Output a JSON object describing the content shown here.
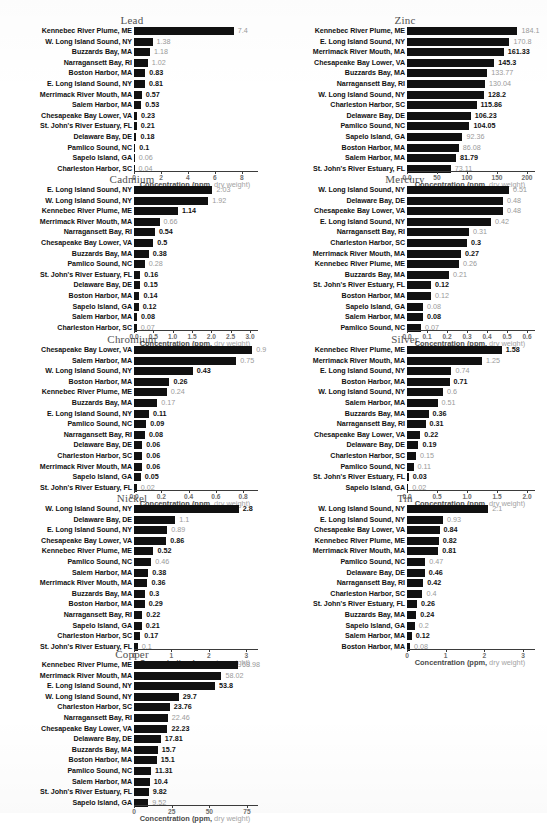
{
  "figure": {
    "axis_title_main": "Concentration (ppm,",
    "axis_title_dim": " dry weight)",
    "axis_title_full": "Concentration (ppm, dry weight)"
  },
  "chart_data": [
    {
      "type": "bar",
      "orientation": "horizontal",
      "title": "Lead",
      "xlabel": "Concentration (ppm, dry weight)",
      "ylabel": "",
      "xlim": [
        0,
        8.6
      ],
      "ticks": [
        "0",
        "2",
        "4",
        "6",
        "8"
      ],
      "tickvals": [
        0,
        2,
        4,
        6,
        8
      ],
      "grid": false,
      "categories": [
        "Kennebec River Plume, ME",
        "W. Long Island Sound, NY",
        "Buzzards Bay, MA",
        "Narragansett Bay, RI",
        "Boston Harbor, MA",
        "E. Long Island Sound, NY",
        "Merrimack River Mouth, MA",
        "Salem Harbor, MA",
        "Chesapeake Bay Lower, VA",
        "St. John's River Estuary, FL",
        "Delaware Bay, DE",
        "Pamlico Sound, NC",
        "Sapelo Island, GA",
        "Charleston Harbor, SC"
      ],
      "values": [
        7.4,
        1.38,
        1.18,
        1.02,
        0.83,
        0.81,
        0.57,
        0.53,
        0.23,
        0.21,
        0.18,
        0.1,
        0.06,
        0.04
      ],
      "labels": [
        "7.4",
        "1.38",
        "1.18",
        "1.02",
        "0.83",
        "0.81",
        "0.57",
        "0.53",
        "0.23",
        "0.21",
        "0.18",
        "0.1",
        "0.06",
        "0.04"
      ],
      "faint": [
        true,
        true,
        true,
        true,
        false,
        false,
        false,
        false,
        false,
        false,
        false,
        false,
        true,
        true
      ]
    },
    {
      "type": "bar",
      "orientation": "horizontal",
      "title": "Zinc",
      "xlabel": "Concentration (ppm, dry weight)",
      "ylabel": "",
      "xlim": [
        0,
        200
      ],
      "ticks": [
        "0.0",
        "50",
        "100",
        "150",
        "200"
      ],
      "tickvals": [
        0,
        50,
        100,
        150,
        200
      ],
      "grid": false,
      "categories": [
        "Kennebec River Plume, ME",
        "E. Long Island Sound, NY",
        "Merrimack River Mouth, MA",
        "Chesapeake Bay Lower, VA",
        "Buzzards Bay, MA",
        "Narragansett Bay, RI",
        "W. Long Island Sound, NY",
        "Charleston Harbor, SC",
        "Delaware Bay, DE",
        "Pamlico Sound, NC",
        "Sapelo Island, GA",
        "Boston Harbor, MA",
        "Salem Harbor, MA",
        "St. John's River Estuary, FL"
      ],
      "values": [
        184.1,
        170.8,
        161.33,
        145.3,
        133.77,
        130.04,
        128.2,
        115.86,
        106.23,
        104.05,
        92.36,
        86.08,
        81.79,
        73.11
      ],
      "labels": [
        "184.1",
        "170.8",
        "161.33",
        "145.3",
        "133.77",
        "130.04",
        "128.2",
        "115.86",
        "106.23",
        "104.05",
        "92.36",
        "86.08",
        "81.79",
        "73.11"
      ],
      "faint": [
        true,
        true,
        false,
        false,
        true,
        true,
        false,
        false,
        false,
        false,
        true,
        true,
        false,
        true
      ]
    },
    {
      "type": "bar",
      "orientation": "horizontal",
      "title": "Cadmium",
      "xlabel": "Concentration (ppm, dry weight)",
      "ylabel": "",
      "xlim": [
        0,
        3.0
      ],
      "ticks": [
        "0.0",
        "0.5",
        "1.0",
        "1.5",
        "2.0",
        "2.5",
        "3.0"
      ],
      "tickvals": [
        0,
        0.5,
        1.0,
        1.5,
        2.0,
        2.5,
        3.0
      ],
      "grid": false,
      "categories": [
        "E. Long Island Sound, NY",
        "W. Long Island Sound, NY",
        "Kennebec River Plume, ME",
        "Merrimack River Mouth, MA",
        "Narragansett Bay, RI",
        "Chesapeake Bay Lower, VA",
        "Buzzards Bay, MA",
        "Pamlico Sound, NC",
        "St. John's River Estuary, FL",
        "Delaware Bay, DE",
        "Boston Harbor, MA",
        "Sapelo Island, GA",
        "Salem Harbor, MA",
        "Charleston Harbor, SC"
      ],
      "values": [
        2.03,
        1.92,
        1.14,
        0.66,
        0.54,
        0.5,
        0.38,
        0.28,
        0.16,
        0.15,
        0.14,
        0.12,
        0.08,
        0.07
      ],
      "labels": [
        "2.03",
        "1.92",
        "1.14",
        "0.66",
        "0.54",
        "0.5",
        "0.38",
        "0.28",
        "0.16",
        "0.15",
        "0.14",
        "0.12",
        "0.08",
        "0.07"
      ],
      "faint": [
        true,
        true,
        false,
        true,
        false,
        false,
        false,
        true,
        false,
        false,
        false,
        false,
        false,
        true
      ]
    },
    {
      "type": "bar",
      "orientation": "horizontal",
      "title": "Mercury",
      "xlabel": "Concentration (ppm, dry weight)",
      "ylabel": "",
      "xlim": [
        0,
        0.6
      ],
      "ticks": [
        "0.0",
        "0.1",
        "0.2",
        "0.3",
        "0.4",
        "0.5",
        "0.6"
      ],
      "tickvals": [
        0,
        0.1,
        0.2,
        0.3,
        0.4,
        0.5,
        0.6
      ],
      "grid": false,
      "categories": [
        "W. Long Island Sound, NY",
        "Delaware Bay, DE",
        "Chesapeake Bay Lower, VA",
        "E. Long Island Sound, NY",
        "Narragansett Bay, RI",
        "Charleston Harbor, SC",
        "Merrimack River Mouth, MA",
        "Kennebec River Plume, ME",
        "Buzzards Bay, MA",
        "St. John's River Estuary, FL",
        "Boston Harbor, MA",
        "Sapelo Island, GA",
        "Salem Harbor, MA",
        "Pamlico Sound, NC"
      ],
      "values": [
        0.51,
        0.48,
        0.48,
        0.42,
        0.31,
        0.3,
        0.27,
        0.26,
        0.21,
        0.12,
        0.12,
        0.08,
        0.08,
        0.07
      ],
      "labels": [
        "0.51",
        "0.48",
        "0.48",
        "0.42",
        "0.31",
        "0.3",
        "0.27",
        "0.26",
        "0.21",
        "0.12",
        "0.12",
        "0.08",
        "0.08",
        "0.07"
      ],
      "faint": [
        true,
        true,
        true,
        true,
        true,
        false,
        false,
        true,
        true,
        false,
        true,
        true,
        false,
        true
      ]
    },
    {
      "type": "bar",
      "orientation": "horizontal",
      "title": "Chromium",
      "xlabel": "Concentration (ppm, dry weight)",
      "ylabel": "",
      "xlim": [
        0,
        0.85
      ],
      "ticks": [
        "0.0",
        "0.2",
        "0.4",
        "0.6",
        "0.8",
        "1.0"
      ],
      "tickvals": [
        0,
        0.2,
        0.4,
        0.6,
        0.8,
        1.0
      ],
      "grid": false,
      "categories": [
        "Chesapeake Bay Lower, VA",
        "Salem Harbor, MA",
        "W. Long Island Sound, NY",
        "Boston Harbor, MA",
        "Kennebec River Plume, ME",
        "Buzzards Bay, MA",
        "E. Long Island Sound, NY",
        "Pamlico Sound, NC",
        "Narragansett Bay, RI",
        "Delaware Bay, DE",
        "Charleston Harbor, SC",
        "Merrimack River Mouth, MA",
        "Sapelo Island, GA",
        "St. John's River Estuary, FL"
      ],
      "values": [
        0.9,
        0.75,
        0.43,
        0.26,
        0.24,
        0.17,
        0.11,
        0.09,
        0.08,
        0.06,
        0.06,
        0.06,
        0.05,
        0.02
      ],
      "labels": [
        "0.9",
        "0.75",
        "0.43",
        "0.26",
        "0.24",
        "0.17",
        "0.11",
        "0.09",
        "0.08",
        "0.06",
        "0.06",
        "0.06",
        "0.05",
        "0.02"
      ],
      "faint": [
        true,
        true,
        false,
        false,
        true,
        true,
        false,
        false,
        false,
        false,
        false,
        false,
        false,
        true
      ]
    },
    {
      "type": "bar",
      "orientation": "horizontal",
      "title": "Silver",
      "xlabel": "Concentration (ppm, dry weight)",
      "ylabel": "",
      "xlim": [
        0,
        2.0
      ],
      "ticks": [
        "0.0",
        "0.5",
        "1.0",
        "1.5",
        "2.0"
      ],
      "tickvals": [
        0,
        0.5,
        1.0,
        1.5,
        2.0
      ],
      "grid": false,
      "categories": [
        "Kennebec River Plume, ME",
        "Merrimack River Mouth, MA",
        "E. Long Island Sound, NY",
        "Boston Harbor, MA",
        "W. Long Island Sound, NY",
        "Salem Harbor, MA",
        "Buzzards Bay, MA",
        "Narragansett Bay, RI",
        "Chesapeake Bay Lower, VA",
        "Delaware Bay, DE",
        "Charleston Harbor, SC",
        "Pamlico Sound, NC",
        "St. John's River Estuary, FL",
        "Sapelo Island, GA"
      ],
      "values": [
        1.58,
        1.25,
        0.74,
        0.71,
        0.6,
        0.51,
        0.36,
        0.31,
        0.22,
        0.19,
        0.15,
        0.11,
        0.03,
        0.02
      ],
      "labels": [
        "1.58",
        "1.25",
        "0.74",
        "0.71",
        "0.6",
        "0.51",
        "0.36",
        "0.31",
        "0.22",
        "0.19",
        "0.15",
        "0.11",
        "0.03",
        "0.02"
      ],
      "faint": [
        false,
        true,
        true,
        false,
        true,
        true,
        false,
        false,
        false,
        false,
        true,
        true,
        false,
        true
      ]
    },
    {
      "type": "bar",
      "orientation": "horizontal",
      "title": "Nickel",
      "xlabel": "Concentration (ppm, dry weight)",
      "ylabel": "",
      "xlim": [
        0,
        3.1
      ],
      "ticks": [
        "0",
        "1",
        "2",
        "3"
      ],
      "tickvals": [
        0,
        1,
        2,
        3
      ],
      "grid": false,
      "categories": [
        "W. Long Island Sound, NY",
        "Delaware Bay, DE",
        "E. Long Island Sound, NY",
        "Chesapeake Bay Lower, VA",
        "Kennebec River Plume, ME",
        "Pamlico Sound, NC",
        "Salem Harbor, MA",
        "Merrimack River Mouth, MA",
        "Buzzards Bay, MA",
        "Boston Harbor, MA",
        "Narragansett Bay, RI",
        "Sapelo Island, GA",
        "Charleston Harbor, SC",
        "St. John's River Estuary, FL"
      ],
      "values": [
        2.8,
        1.1,
        0.89,
        0.86,
        0.52,
        0.46,
        0.38,
        0.36,
        0.3,
        0.29,
        0.22,
        0.21,
        0.17,
        0.1
      ],
      "labels": [
        "2.8",
        "1.1",
        "0.89",
        "0.86",
        "0.52",
        "0.46",
        "0.38",
        "0.36",
        "0.3",
        "0.29",
        "0.22",
        "0.21",
        "0.17",
        "0.1"
      ],
      "faint": [
        false,
        true,
        true,
        false,
        false,
        true,
        false,
        false,
        false,
        false,
        false,
        false,
        false,
        true
      ]
    },
    {
      "type": "bar",
      "orientation": "horizontal",
      "title": "Tin",
      "xlabel": "Concentration (ppm, dry weight)",
      "ylabel": "",
      "xlim": [
        0,
        3.1
      ],
      "ticks": [
        "0",
        "1",
        "2",
        "3"
      ],
      "tickvals": [
        0,
        1,
        2,
        3
      ],
      "grid": false,
      "categories": [
        "W. Long Island Sound, NY",
        "E. Long Island Sound, NY",
        "Chesapeake Bay Lower, VA",
        "Kennebec River Plume, ME",
        "Merrimack River Mouth, MA",
        "Pamlico Sound, NC",
        "Delaware Bay, DE",
        "Narragansett Bay, RI",
        "Charleston Harbor, SC",
        "St. John's River Estuary, FL",
        "Buzzards Bay, MA",
        "Sapelo Island, GA",
        "Salem Harbor, MA",
        "Boston Harbor, MA"
      ],
      "values": [
        2.1,
        0.93,
        0.84,
        0.82,
        0.81,
        0.47,
        0.46,
        0.42,
        0.4,
        0.26,
        0.24,
        0.2,
        0.12,
        0.08
      ],
      "labels": [
        "2.1",
        "0.93",
        "0.84",
        "0.82",
        "0.81",
        "0.47",
        "0.46",
        "0.42",
        "0.4",
        "0.26",
        "0.24",
        "0.2",
        "0.12",
        "0.08"
      ],
      "faint": [
        true,
        true,
        false,
        false,
        false,
        true,
        false,
        false,
        true,
        false,
        false,
        true,
        false,
        true
      ]
    },
    {
      "type": "bar",
      "orientation": "horizontal",
      "title": "Copper",
      "xlabel": "Concentration (ppm, dry weight)",
      "ylabel": "",
      "xlim": [
        0,
        77
      ],
      "ticks": [
        "0",
        "25",
        "50",
        "75"
      ],
      "tickvals": [
        0,
        25,
        50,
        75
      ],
      "grid": false,
      "categories": [
        "Kennebec River Plume, ME",
        "Merrimack River Mouth, MA",
        "E. Long Island Sound, NY",
        "W. Long Island Sound, NY",
        "Charleston Harbor, SC",
        "Narragansett Bay, RI",
        "Chesapeake Bay Lower, VA",
        "Delaware Bay, DE",
        "Buzzards Bay, MA",
        "Boston Harbor, MA",
        "Pamlico Sound, NC",
        "Salem Harbor, MA",
        "St. John's River Estuary, FL",
        "Sapelo Island, GA"
      ],
      "values": [
        68.98,
        58.02,
        53.8,
        29.7,
        23.76,
        22.46,
        22.23,
        17.81,
        15.7,
        15.1,
        11.31,
        10.4,
        9.82,
        9.52
      ],
      "labels": [
        "68.98",
        "58.02",
        "53.8",
        "29.7",
        "23.76",
        "22.46",
        "22.23",
        "17.81",
        "15.7",
        "15.1",
        "11.31",
        "10.4",
        "9.82",
        "9.52"
      ],
      "faint": [
        true,
        true,
        false,
        false,
        false,
        true,
        false,
        false,
        false,
        false,
        false,
        false,
        false,
        true
      ]
    }
  ],
  "layout": {
    "panels": [
      {
        "chart": 0,
        "left": 0,
        "top": 14,
        "width": 273,
        "label_w": 132,
        "plot_w": 116
      },
      {
        "chart": 1,
        "left": 273,
        "top": 14,
        "width": 274,
        "label_w": 132,
        "plot_w": 120
      },
      {
        "chart": 2,
        "left": 0,
        "top": 173,
        "width": 273,
        "label_w": 132,
        "plot_w": 116
      },
      {
        "chart": 3,
        "left": 273,
        "top": 173,
        "width": 274,
        "label_w": 132,
        "plot_w": 120
      },
      {
        "chart": 4,
        "left": 0,
        "top": 333,
        "width": 273,
        "label_w": 132,
        "plot_w": 116
      },
      {
        "chart": 5,
        "left": 273,
        "top": 333,
        "width": 274,
        "label_w": 132,
        "plot_w": 120
      },
      {
        "chart": 6,
        "left": 0,
        "top": 492,
        "width": 273,
        "label_w": 132,
        "plot_w": 116
      },
      {
        "chart": 7,
        "left": 273,
        "top": 492,
        "width": 274,
        "label_w": 132,
        "plot_w": 120
      },
      {
        "chart": 8,
        "left": 0,
        "top": 648,
        "width": 300,
        "label_w": 132,
        "plot_w": 116
      }
    ]
  }
}
